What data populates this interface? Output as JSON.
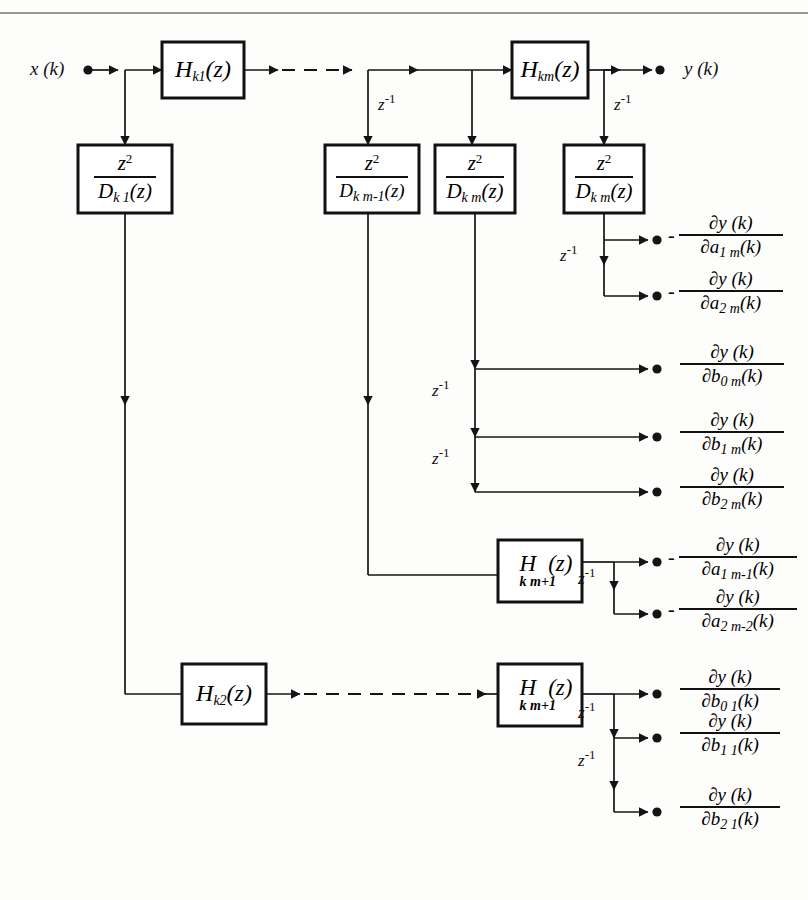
{
  "diagram": {
    "input_label": "x (k)",
    "output_label": "y (k)",
    "delay_label": "z",
    "delay_exp": "-1",
    "minus_sign": "-",
    "numerator": "z",
    "numerator_exp": "2",
    "blocks": {
      "h_k1": {
        "base": "H",
        "sub": "k1",
        "arg": "(z)"
      },
      "h_km": {
        "base": "H",
        "sub": "km",
        "arg": "(z)"
      },
      "h_k2": {
        "base": "H",
        "sub": "k2",
        "arg": "(z)"
      },
      "h_kmp1_upper": {
        "base": "H",
        "sub": "k m+1",
        "arg": "(z)"
      },
      "h_kmp1_lower": {
        "base": "H",
        "sub": "k m+1",
        "arg": "(z)"
      }
    },
    "fraction_blocks": [
      {
        "id": "d_k1",
        "num": "z",
        "num_exp": "2",
        "den_base": "D",
        "den_sub": "k  1",
        "den_arg": "(z)"
      },
      {
        "id": "d_km1",
        "num": "z",
        "num_exp": "2",
        "den_base": "D",
        "den_sub": "k  m-1",
        "den_arg": "(z)"
      },
      {
        "id": "d_km_a",
        "num": "z",
        "num_exp": "2",
        "den_base": "D",
        "den_sub": "k  m",
        "den_arg": "(z)"
      },
      {
        "id": "d_km_b",
        "num": "z",
        "num_exp": "2",
        "den_base": "D",
        "den_sub": "k  m",
        "den_arg": "(z)"
      }
    ],
    "outputs": [
      {
        "id": "a1m",
        "sign": "-",
        "num": "∂y (k)",
        "den_base": "∂a",
        "den_sub": "1  m",
        "den_arg": "(k)"
      },
      {
        "id": "a2m",
        "sign": "-",
        "num": "∂y (k)",
        "den_base": "∂a",
        "den_sub": "2  m",
        "den_arg": "(k)"
      },
      {
        "id": "b0m",
        "sign": "",
        "num": "∂y (k)",
        "den_base": "∂b",
        "den_sub": "0  m",
        "den_arg": "(k)"
      },
      {
        "id": "b1m",
        "sign": "",
        "num": "∂y (k)",
        "den_base": "∂b",
        "den_sub": "1  m",
        "den_arg": "(k)"
      },
      {
        "id": "b2m",
        "sign": "",
        "num": "∂y (k)",
        "den_base": "∂b",
        "den_sub": "2  m",
        "den_arg": "(k)"
      },
      {
        "id": "a1m1",
        "sign": "-",
        "num": "∂y (k)",
        "den_base": "∂a",
        "den_sub": "1  m-1",
        "den_arg": "(k)"
      },
      {
        "id": "a2m2",
        "sign": "-",
        "num": "∂y (k)",
        "den_base": "∂a",
        "den_sub": "2  m-2",
        "den_arg": "(k)"
      },
      {
        "id": "b01",
        "sign": "",
        "num": "∂y (k)",
        "den_base": "∂b",
        "den_sub": "0  1",
        "den_arg": "(k)"
      },
      {
        "id": "b11",
        "sign": "",
        "num": "∂y (k)",
        "den_base": "∂b",
        "den_sub": "1  1",
        "den_arg": "(k)"
      },
      {
        "id": "b21",
        "sign": "",
        "num": "∂y (k)",
        "den_base": "∂b",
        "den_sub": "2  1",
        "den_arg": "(k)"
      }
    ],
    "delay_taps": [
      {
        "id": "tap-km1-top"
      },
      {
        "id": "tap-km-top"
      },
      {
        "id": "tap-a1m"
      },
      {
        "id": "tap-b0m"
      },
      {
        "id": "tap-b1m"
      },
      {
        "id": "tap-hmp1-upper"
      },
      {
        "id": "tap-hmp1-lower-1"
      },
      {
        "id": "tap-hmp1-lower-2"
      }
    ],
    "colors": {
      "line": "#141414",
      "block_border": "#111111",
      "background": "#fdfdfc",
      "rule": "#9a9a9a"
    }
  }
}
